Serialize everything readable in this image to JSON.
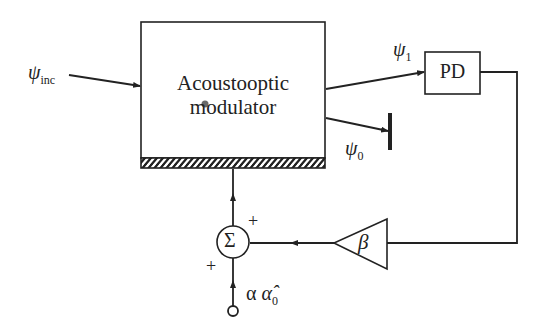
{
  "diagram": {
    "modulator": {
      "line1": "Acoustooptic",
      "line2": "modulator"
    },
    "detector": {
      "label": "PD"
    },
    "amplifier": {
      "label": "β"
    },
    "summer": {
      "label": "Σ",
      "plus_top": "+",
      "plus_left": "+"
    },
    "signals": {
      "incident": {
        "symbol": "ψ",
        "subscript": "inc"
      },
      "first_order": {
        "symbol": "ψ",
        "subscript": "1"
      },
      "zero_order": {
        "symbol": "ψ",
        "subscript": "0"
      },
      "input": {
        "prefix": "α",
        "symbol": "α̂",
        "subscript": "0"
      }
    },
    "colors": {
      "line": "#222222",
      "background": "#ffffff"
    }
  }
}
